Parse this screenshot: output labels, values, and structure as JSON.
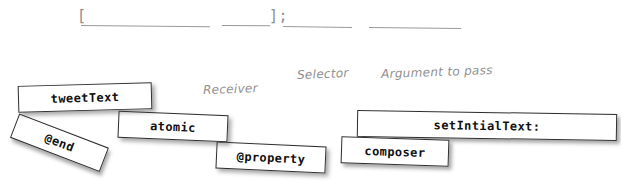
{
  "exercise": {
    "code_template": {
      "bracket_open": "[",
      "bracket_close": "];",
      "blanks": [
        {
          "id": "receiver-blank",
          "value": ""
        },
        {
          "id": "selector-blank",
          "value": ""
        },
        {
          "id": "trailing-blank-1",
          "value": ""
        },
        {
          "id": "argument-blank",
          "value": ""
        }
      ]
    },
    "annotations": [
      {
        "id": "receiver-annotation",
        "label": "Receiver"
      },
      {
        "id": "selector-annotation",
        "label": "Selector"
      },
      {
        "id": "argument-annotation",
        "label": "Argument to pass"
      }
    ],
    "tiles": [
      {
        "id": "tile-tweettext",
        "label": "tweetText"
      },
      {
        "id": "tile-end",
        "label": "@end"
      },
      {
        "id": "tile-atomic",
        "label": "atomic"
      },
      {
        "id": "tile-property",
        "label": "@property"
      },
      {
        "id": "tile-setintialtext",
        "label": "setIntialText:"
      },
      {
        "id": "tile-composer",
        "label": "composer"
      }
    ]
  },
  "colors": {
    "tile_fill": "#ffffff",
    "tile_border": "#2e2e2e",
    "annotation_text": "#8f8f8f",
    "blank_line": "#9a9a9a",
    "background": "#ffffff"
  }
}
